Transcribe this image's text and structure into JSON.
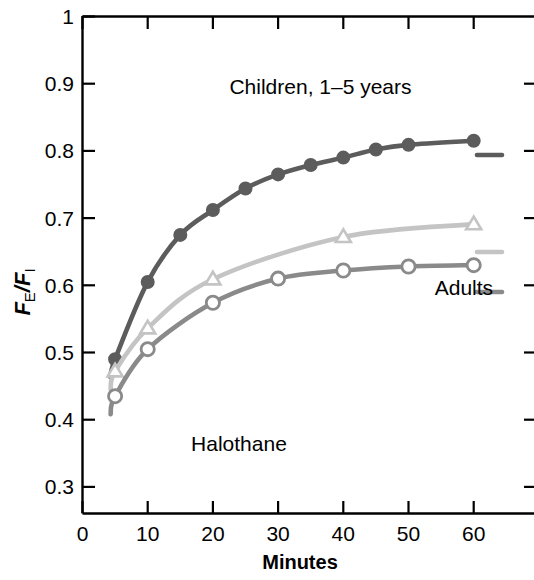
{
  "chart_data": {
    "type": "line",
    "title": "",
    "subtitle": "",
    "xlabel": "Minutes",
    "ylabel": "FE/FI",
    "ylabel_parts": {
      "f1": "F",
      "sub1": "E",
      "slash": "/",
      "f2": "F",
      "sub2": "I"
    },
    "xlim": [
      0,
      65
    ],
    "ylim": [
      0.26,
      1.0
    ],
    "xticks": [
      "0",
      "10",
      "20",
      "30",
      "40",
      "50",
      "60"
    ],
    "xtick_values": [
      0,
      10,
      20,
      30,
      40,
      50,
      60
    ],
    "yticks": [
      "0.3",
      "0.4",
      "0.5",
      "0.6",
      "0.7",
      "0.8",
      "0.9",
      "1"
    ],
    "ytick_values": [
      0.3,
      0.4,
      0.5,
      0.6,
      0.7,
      0.8,
      0.9,
      1.0
    ],
    "grid": false,
    "legend": "inline-annotations",
    "annotations": [
      {
        "name": "children-label",
        "text": "Children, 1–5 years",
        "x": 36.5,
        "y": 0.885
      },
      {
        "name": "adults-label",
        "text": "Adults",
        "x": 58.5,
        "y": 0.585
      },
      {
        "name": "agent-label",
        "text": "Halothane",
        "x": 24.0,
        "y": 0.353
      }
    ],
    "series": [
      {
        "name": "Children, 1–5 years",
        "marker": "filled-circle",
        "color": "#5c5c5c",
        "x": [
          5,
          10,
          15,
          20,
          25,
          30,
          35,
          40,
          45,
          50,
          60
        ],
        "values": [
          0.49,
          0.605,
          0.675,
          0.712,
          0.744,
          0.765,
          0.779,
          0.79,
          0.802,
          0.809,
          0.815
        ]
      },
      {
        "name": "Intermediate",
        "marker": "open-triangle",
        "color": "#c4c4c4",
        "x": [
          5,
          10,
          20,
          40,
          60
        ],
        "values": [
          0.472,
          0.536,
          0.609,
          0.672,
          0.691
        ]
      },
      {
        "name": "Adults",
        "marker": "open-circle",
        "color": "#8a8a8a",
        "x": [
          5,
          10,
          20,
          30,
          40,
          50,
          60
        ],
        "values": [
          0.435,
          0.505,
          0.574,
          0.61,
          0.622,
          0.628,
          0.63
        ]
      }
    ]
  }
}
